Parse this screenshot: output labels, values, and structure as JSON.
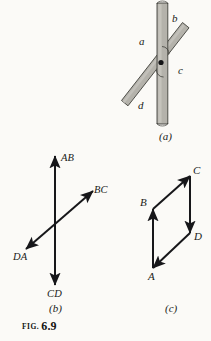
{
  "figure": {
    "caption_prefix": "FIG.",
    "caption_number": "6.9",
    "background_color": "#fbfaf7",
    "ink_color": "#1a1a18",
    "bar_fill_color": "#b4b2ab",
    "bar_stroke_color": "#3a3a36"
  },
  "panel_a": {
    "label": "(a)",
    "description": "Two overlapping gray bars pivoting about a common black dot",
    "bar_labels": [
      {
        "text": "a",
        "position": "upper-left"
      },
      {
        "text": "b",
        "position": "upper-right"
      },
      {
        "text": "c",
        "position": "right"
      },
      {
        "text": "d",
        "position": "lower-left"
      }
    ],
    "pivot": {
      "shown": true,
      "shape": "filled-dot"
    }
  },
  "panel_b": {
    "label": "(b)",
    "description": "Four vectors radiating from a common origin",
    "vectors": [
      {
        "name": "AB",
        "direction": "up",
        "angle_deg": 90
      },
      {
        "name": "BC",
        "direction": "upper-right",
        "angle_deg": 40
      },
      {
        "name": "CD",
        "direction": "down",
        "angle_deg": 270
      },
      {
        "name": "DA",
        "direction": "lower-left",
        "angle_deg": 220
      }
    ]
  },
  "panel_c": {
    "label": "(c)",
    "description": "Closed parallelogram of the four vectors placed head to tail",
    "vertices": [
      {
        "name": "A",
        "position": "bottom-left"
      },
      {
        "name": "B",
        "position": "middle-left"
      },
      {
        "name": "C",
        "position": "top-right"
      },
      {
        "name": "D",
        "position": "middle-right"
      }
    ],
    "edges": [
      {
        "from": "A",
        "to": "B"
      },
      {
        "from": "B",
        "to": "C"
      },
      {
        "from": "C",
        "to": "D"
      },
      {
        "from": "D",
        "to": "A"
      }
    ]
  }
}
